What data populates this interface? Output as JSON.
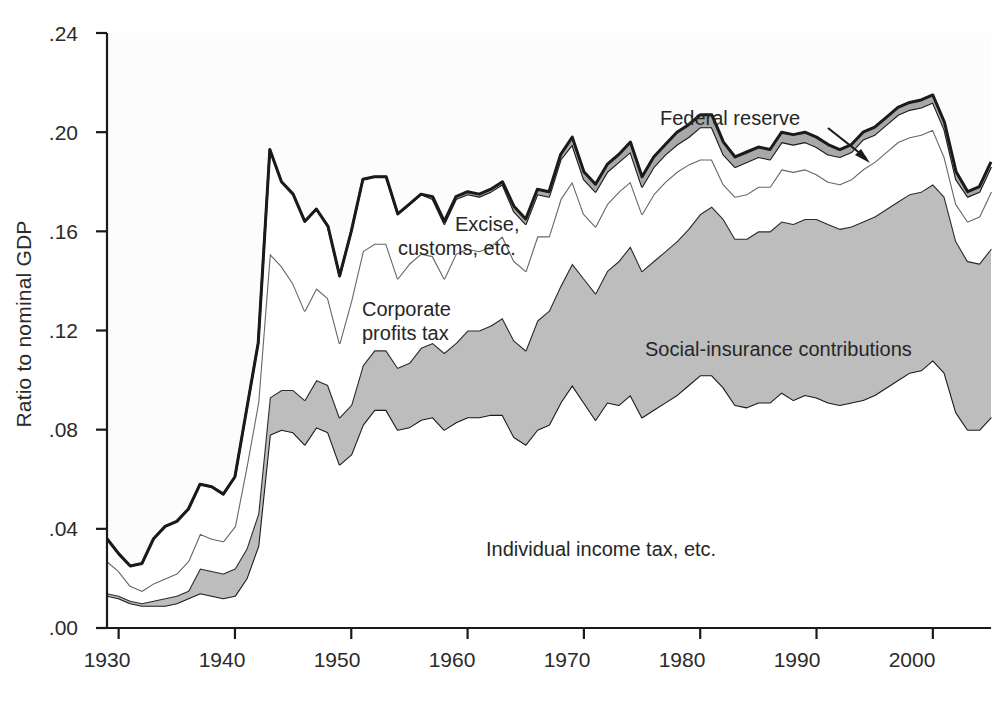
{
  "chart_data": {
    "type": "area",
    "title": "",
    "subtitle": "",
    "xlabel": "",
    "ylabel": "Ratio to nominal GDP",
    "xlim": [
      1929,
      2005
    ],
    "ylim": [
      0.0,
      0.24
    ],
    "grid": false,
    "legend_position": "inline-annotations",
    "stacked": true,
    "ytick_labels": [
      ".00",
      ".04",
      ".08",
      ".12",
      ".16",
      ".20",
      ".24"
    ],
    "ytick_values": [
      0.0,
      0.04,
      0.08,
      0.12,
      0.16,
      0.2,
      0.24
    ],
    "xtick_labels": [
      "1930",
      "1940",
      "1950",
      "1960",
      "1970",
      "1980",
      "1990",
      "2000"
    ],
    "xtick_values": [
      1930,
      1940,
      1950,
      1960,
      1970,
      1980,
      1990,
      2000
    ],
    "x": [
      1929,
      1930,
      1931,
      1932,
      1933,
      1934,
      1935,
      1936,
      1937,
      1938,
      1939,
      1940,
      1941,
      1942,
      1943,
      1944,
      1945,
      1946,
      1947,
      1948,
      1949,
      1950,
      1951,
      1952,
      1953,
      1954,
      1955,
      1956,
      1957,
      1958,
      1959,
      1960,
      1961,
      1962,
      1963,
      1964,
      1965,
      1966,
      1967,
      1968,
      1969,
      1970,
      1971,
      1972,
      1973,
      1974,
      1975,
      1976,
      1977,
      1978,
      1979,
      1980,
      1981,
      1982,
      1983,
      1984,
      1985,
      1986,
      1987,
      1988,
      1989,
      1990,
      1991,
      1992,
      1993,
      1994,
      1995,
      1996,
      1997,
      1998,
      1999,
      2000,
      2001,
      2002,
      2003,
      2004,
      2005
    ],
    "series": [
      {
        "name": "Individual income tax, etc.",
        "fill": "#ffffff",
        "line": "#1a1a1a",
        "values": [
          0.013,
          0.012,
          0.01,
          0.009,
          0.009,
          0.009,
          0.01,
          0.012,
          0.014,
          0.013,
          0.012,
          0.013,
          0.02,
          0.033,
          0.078,
          0.08,
          0.079,
          0.074,
          0.081,
          0.079,
          0.066,
          0.07,
          0.082,
          0.088,
          0.088,
          0.08,
          0.081,
          0.084,
          0.085,
          0.08,
          0.083,
          0.085,
          0.085,
          0.086,
          0.086,
          0.077,
          0.074,
          0.08,
          0.082,
          0.091,
          0.098,
          0.091,
          0.084,
          0.091,
          0.09,
          0.094,
          0.085,
          0.088,
          0.091,
          0.094,
          0.098,
          0.102,
          0.102,
          0.097,
          0.09,
          0.089,
          0.091,
          0.091,
          0.095,
          0.092,
          0.094,
          0.093,
          0.091,
          0.09,
          0.091,
          0.092,
          0.094,
          0.097,
          0.1,
          0.103,
          0.104,
          0.108,
          0.103,
          0.087,
          0.08,
          0.08,
          0.085
        ]
      },
      {
        "name": "Social-insurance contributions",
        "fill": "#bdbdbd",
        "line": "#2b2b2b",
        "values": [
          0.001,
          0.001,
          0.001,
          0.001,
          0.002,
          0.003,
          0.003,
          0.003,
          0.01,
          0.01,
          0.01,
          0.011,
          0.012,
          0.013,
          0.015,
          0.016,
          0.017,
          0.018,
          0.019,
          0.019,
          0.019,
          0.02,
          0.024,
          0.024,
          0.024,
          0.025,
          0.026,
          0.029,
          0.03,
          0.031,
          0.032,
          0.035,
          0.035,
          0.036,
          0.039,
          0.039,
          0.038,
          0.044,
          0.046,
          0.047,
          0.049,
          0.05,
          0.051,
          0.053,
          0.058,
          0.06,
          0.059,
          0.06,
          0.061,
          0.062,
          0.063,
          0.065,
          0.068,
          0.068,
          0.067,
          0.068,
          0.069,
          0.069,
          0.069,
          0.071,
          0.071,
          0.072,
          0.072,
          0.071,
          0.071,
          0.072,
          0.072,
          0.072,
          0.072,
          0.072,
          0.072,
          0.071,
          0.071,
          0.069,
          0.068,
          0.067,
          0.068
        ]
      },
      {
        "name": "Corporate profits tax",
        "fill": "#ffffff",
        "line": "#666666",
        "values": [
          0.013,
          0.01,
          0.006,
          0.005,
          0.007,
          0.008,
          0.009,
          0.012,
          0.014,
          0.013,
          0.013,
          0.017,
          0.033,
          0.045,
          0.058,
          0.05,
          0.043,
          0.036,
          0.037,
          0.035,
          0.03,
          0.042,
          0.046,
          0.043,
          0.043,
          0.036,
          0.04,
          0.038,
          0.035,
          0.03,
          0.036,
          0.033,
          0.032,
          0.032,
          0.033,
          0.032,
          0.032,
          0.034,
          0.03,
          0.035,
          0.033,
          0.026,
          0.027,
          0.027,
          0.028,
          0.026,
          0.023,
          0.027,
          0.028,
          0.028,
          0.026,
          0.022,
          0.019,
          0.014,
          0.017,
          0.018,
          0.018,
          0.018,
          0.021,
          0.021,
          0.02,
          0.018,
          0.017,
          0.018,
          0.019,
          0.021,
          0.022,
          0.023,
          0.024,
          0.023,
          0.023,
          0.022,
          0.016,
          0.015,
          0.016,
          0.019,
          0.023
        ]
      },
      {
        "name": "Excise, customs, etc.",
        "fill": "#ffffff",
        "line": "#1a1a1a",
        "values": [
          0.009,
          0.007,
          0.008,
          0.011,
          0.018,
          0.021,
          0.021,
          0.021,
          0.02,
          0.021,
          0.019,
          0.02,
          0.023,
          0.024,
          0.042,
          0.034,
          0.036,
          0.036,
          0.032,
          0.029,
          0.027,
          0.028,
          0.029,
          0.027,
          0.027,
          0.026,
          0.024,
          0.024,
          0.023,
          0.022,
          0.022,
          0.022,
          0.022,
          0.022,
          0.021,
          0.02,
          0.019,
          0.017,
          0.016,
          0.016,
          0.015,
          0.014,
          0.014,
          0.013,
          0.012,
          0.012,
          0.011,
          0.011,
          0.011,
          0.011,
          0.011,
          0.013,
          0.013,
          0.012,
          0.012,
          0.013,
          0.012,
          0.011,
          0.011,
          0.011,
          0.011,
          0.011,
          0.011,
          0.011,
          0.011,
          0.012,
          0.011,
          0.011,
          0.011,
          0.011,
          0.011,
          0.011,
          0.011,
          0.01,
          0.01,
          0.01,
          0.01
        ]
      },
      {
        "name": "Federal reserve",
        "fill": "#a8a8a8",
        "line": "#1a1a1a",
        "values": [
          0.0,
          0.0,
          0.0,
          0.0,
          0.0,
          0.0,
          0.0,
          0.0,
          0.0,
          0.0,
          0.0,
          0.0,
          0.0,
          0.0,
          0.0,
          0.0,
          0.0,
          0.0,
          0.0,
          0.0,
          0.0,
          0.0,
          0.0,
          0.0,
          0.0,
          0.0,
          0.0,
          0.0,
          0.001,
          0.001,
          0.001,
          0.001,
          0.001,
          0.001,
          0.001,
          0.002,
          0.002,
          0.002,
          0.002,
          0.002,
          0.003,
          0.003,
          0.003,
          0.003,
          0.003,
          0.004,
          0.004,
          0.004,
          0.004,
          0.005,
          0.005,
          0.005,
          0.005,
          0.005,
          0.004,
          0.004,
          0.004,
          0.004,
          0.004,
          0.004,
          0.004,
          0.004,
          0.004,
          0.003,
          0.003,
          0.003,
          0.003,
          0.003,
          0.003,
          0.003,
          0.003,
          0.003,
          0.003,
          0.003,
          0.002,
          0.002,
          0.002
        ]
      }
    ]
  },
  "annotations": {
    "federal_reserve": "Federal reserve",
    "excise_line1": "Excise,",
    "excise_line2": "customs, etc.",
    "corporate_line1": "Corporate",
    "corporate_line2": "profits tax",
    "social_insurance": "Social-insurance contributions",
    "individual": "Individual income tax, etc."
  },
  "axes": {
    "ylabel": "Ratio to nominal GDP",
    "yticks": [
      ".24",
      ".20",
      ".16",
      ".12",
      ".08",
      ".04",
      ".00"
    ],
    "xticks": [
      "1930",
      "1940",
      "1950",
      "1960",
      "1970",
      "1980",
      "1990",
      "2000"
    ]
  },
  "colors": {
    "axis": "#1a1a1a",
    "text": "#2b2b2b",
    "social_insurance_fill": "#bdbdbd",
    "federal_reserve_fill": "#a8a8a8",
    "plot_background": "#fcfcfc"
  }
}
